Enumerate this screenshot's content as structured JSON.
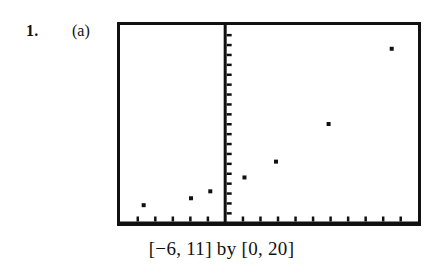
{
  "exercise": {
    "number": "1.",
    "part": "(a)"
  },
  "caption": {
    "text": "[−6, 11] by [0, 20]"
  },
  "chart_data": {
    "type": "scatter",
    "title": "",
    "subtitle": "",
    "xlabel": "",
    "ylabel": "",
    "xlim": [
      -6,
      11
    ],
    "ylim": [
      0,
      20
    ],
    "grid": false,
    "legend": null,
    "window_label": "[−6, 11] by [0, 20]",
    "axes": {
      "x_axis_position": 0,
      "y_axis_position": 0,
      "x_tick_step": 1,
      "y_tick_step": 1,
      "x_tick_values": [
        -5,
        -4,
        -3,
        -2,
        -1,
        0,
        1,
        2,
        3,
        4,
        5,
        6,
        7,
        8,
        9,
        10
      ],
      "y_tick_count": 20,
      "tick_labels_shown": false
    },
    "series": [
      {
        "name": "data",
        "marker": "square-dot",
        "color": "#111111",
        "points": [
          {
            "x": -4.65,
            "y": 1.8
          },
          {
            "x": -1.95,
            "y": 2.5
          },
          {
            "x": -0.85,
            "y": 3.2
          },
          {
            "x": 1.1,
            "y": 4.6
          },
          {
            "x": 2.9,
            "y": 6.2
          },
          {
            "x": 5.9,
            "y": 10.0
          },
          {
            "x": 9.5,
            "y": 17.6
          }
        ]
      }
    ]
  }
}
